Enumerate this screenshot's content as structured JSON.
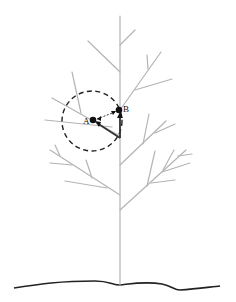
{
  "figure": {
    "type": "tree-growth-diagram",
    "colors": {
      "branch": "#b4b4b4",
      "ground": "#222222",
      "annotation": "#111111",
      "background": "#ffffff"
    },
    "points": [
      {
        "id": "A",
        "label": "A",
        "x": 93,
        "y": 120
      },
      {
        "id": "B",
        "label": "B",
        "x": 119,
        "y": 110
      }
    ],
    "influence_circle": {
      "cx": 92,
      "cy": 121,
      "r": 30,
      "style": "dashed"
    },
    "trunk": {
      "x": 120,
      "top": 15,
      "bottom": 283
    }
  }
}
